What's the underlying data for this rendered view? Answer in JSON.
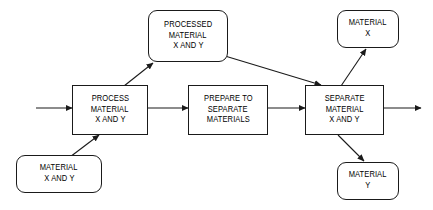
{
  "diagram": {
    "type": "flowchart",
    "stroke_color": "#1a1a1a",
    "fill_color": "#ffffff",
    "nodes": [
      {
        "id": "material-x-and-y-input",
        "shape": "rounded-rectangle",
        "lines": [
          "MATERIAL",
          "X AND Y"
        ],
        "x": 16,
        "y": 155,
        "w": 86,
        "h": 38
      },
      {
        "id": "process-material-x-and-y",
        "shape": "rectangle",
        "lines": [
          "PROCESS",
          "MATERIAL",
          "X AND Y"
        ],
        "x": 72,
        "y": 85,
        "w": 76,
        "h": 50
      },
      {
        "id": "processed-material-x-and-y",
        "shape": "rounded-rectangle",
        "lines": [
          "PROCESSED",
          "MATERIAL",
          "X AND Y"
        ],
        "x": 148,
        "y": 10,
        "w": 80,
        "h": 52
      },
      {
        "id": "prepare-to-separate-materials",
        "shape": "rectangle",
        "lines": [
          "PREPARE TO",
          "SEPARATE",
          "MATERIALS"
        ],
        "x": 188,
        "y": 85,
        "w": 80,
        "h": 50
      },
      {
        "id": "separate-material-x-and-y",
        "shape": "rectangle",
        "lines": [
          "SEPARATE",
          "MATERIAL",
          "X AND Y"
        ],
        "x": 305,
        "y": 85,
        "w": 79,
        "h": 50
      },
      {
        "id": "material-x-output",
        "shape": "rounded-rectangle",
        "lines": [
          "MATERIAL",
          "X"
        ],
        "x": 337,
        "y": 10,
        "w": 62,
        "h": 38
      },
      {
        "id": "material-y-output",
        "shape": "rounded-rectangle",
        "lines": [
          "MATERIAL",
          "Y"
        ],
        "x": 337,
        "y": 162,
        "w": 62,
        "h": 38
      }
    ],
    "connectors": [
      {
        "id": "input-arrow",
        "from": "diagram-edge-left",
        "to": "process-material-x-and-y",
        "arrowhead": true,
        "points": [
          [
            36,
            108
          ],
          [
            72,
            108
          ]
        ]
      },
      {
        "id": "process-to-prepare",
        "from": "process-material-x-and-y",
        "to": "prepare-to-separate-materials",
        "arrowhead": true,
        "points": [
          [
            148,
            108
          ],
          [
            188,
            108
          ]
        ]
      },
      {
        "id": "prepare-to-separate",
        "from": "prepare-to-separate-materials",
        "to": "separate-material-x-and-y",
        "arrowhead": true,
        "points": [
          [
            268,
            108
          ],
          [
            305,
            108
          ]
        ]
      },
      {
        "id": "separate-to-output",
        "from": "separate-material-x-and-y",
        "to": "diagram-edge-right",
        "arrowhead": true,
        "points": [
          [
            384,
            108
          ],
          [
            421,
            108
          ]
        ]
      },
      {
        "id": "material-input-to-process",
        "from": "material-x-and-y-input",
        "to": "process-material-x-and-y",
        "arrowhead": true,
        "points": [
          [
            70,
            157
          ],
          [
            99,
            135
          ]
        ]
      },
      {
        "id": "process-to-processed",
        "from": "process-material-x-and-y",
        "to": "processed-material-x-and-y",
        "arrowhead": true,
        "points": [
          [
            124,
            86
          ],
          [
            153,
            63
          ]
        ]
      },
      {
        "id": "processed-to-separate",
        "from": "processed-material-x-and-y",
        "to": "separate-material-x-and-y",
        "arrowhead": true,
        "points": [
          [
            225,
            56
          ],
          [
            321,
            85
          ]
        ]
      },
      {
        "id": "separate-to-material-x",
        "from": "separate-material-x-and-y",
        "to": "material-x-output",
        "arrowhead": true,
        "points": [
          [
            341,
            86
          ],
          [
            366,
            49
          ]
        ]
      },
      {
        "id": "separate-to-material-y",
        "from": "separate-material-x-and-y",
        "to": "material-y-output",
        "arrowhead": true,
        "points": [
          [
            338,
            135
          ],
          [
            364,
            161
          ]
        ]
      }
    ]
  }
}
